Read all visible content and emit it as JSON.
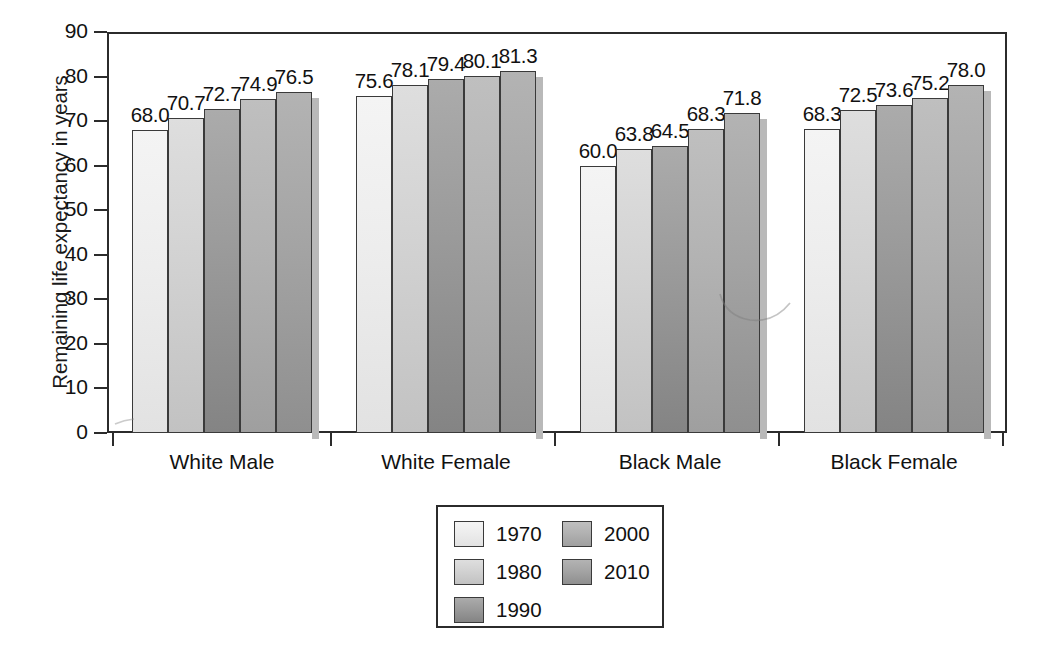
{
  "chart_data": {
    "type": "bar",
    "title": "",
    "xlabel": "",
    "ylabel": "Remaining life expectancy in years",
    "ylim": [
      0,
      90
    ],
    "yticks": [
      0,
      10,
      20,
      30,
      40,
      50,
      60,
      70,
      80,
      90
    ],
    "ytick_labels": [
      "0",
      "10",
      "20",
      "30",
      "40",
      "50",
      "60",
      "70",
      "80",
      "90"
    ],
    "grid": false,
    "legend_position": "bottom-center",
    "categories": [
      "White Male",
      "White Female",
      "Black Male",
      "Black Female"
    ],
    "series": [
      {
        "name": "1970",
        "color": "#ededed",
        "color_top": "#f4f4f4",
        "color_bottom": "#e2e2e2",
        "values": [
          68.0,
          75.6,
          60.0,
          68.3
        ],
        "labels": [
          "68.0",
          "75.6",
          "60.0",
          "68.3"
        ]
      },
      {
        "name": "1980",
        "color": "#d2d2d2",
        "color_top": "#dedede",
        "color_bottom": "#c2c2c2",
        "values": [
          70.7,
          78.1,
          63.8,
          72.5
        ],
        "labels": [
          "70.7",
          "78.1",
          "63.8",
          "72.5"
        ]
      },
      {
        "name": "1990",
        "color": "#9a9a9a",
        "color_top": "#ababab",
        "color_bottom": "#848484",
        "values": [
          72.7,
          79.4,
          64.5,
          73.6
        ],
        "labels": [
          "72.7",
          "79.4",
          "64.5",
          "73.6"
        ]
      },
      {
        "name": "2000",
        "color": "#b2b2b2",
        "color_top": "#bfbfbf",
        "color_bottom": "#9f9f9f",
        "values": [
          74.9,
          80.1,
          68.3,
          75.2
        ],
        "labels": [
          "74.9",
          "80.1",
          "68.3",
          "75.2"
        ]
      },
      {
        "name": "2010",
        "color": "#a4a4a4",
        "color_top": "#b3b3b3",
        "color_bottom": "#8f8f8f",
        "values": [
          76.5,
          81.3,
          71.8,
          78.0
        ],
        "labels": [
          "76.5",
          "81.3",
          "71.8",
          "78.0"
        ]
      }
    ]
  },
  "axis": {
    "y_title": "Remaining life expectancy in years"
  },
  "legend": {
    "entries": [
      {
        "label": "1970"
      },
      {
        "label": "1980"
      },
      {
        "label": "1990"
      },
      {
        "label": "2000"
      },
      {
        "label": "2010"
      }
    ]
  }
}
